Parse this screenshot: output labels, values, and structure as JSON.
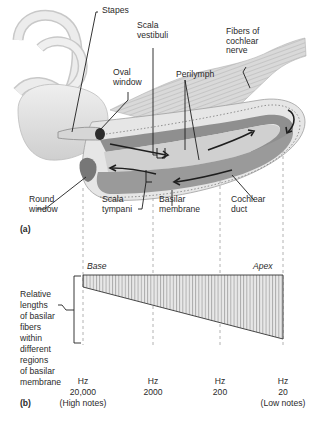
{
  "panel_a": {
    "tag": "(a)",
    "labels": {
      "stapes": "Stapes",
      "scala_vestibuli": "Scala\nvestibuli",
      "fibers_cochlear_nerve": "Fibers of\ncochlear\nnerve",
      "oval_window": "Oval\nwindow",
      "perilymph": "Perilymph",
      "round_window": "Round\nwindow",
      "scala_tympani": "Scala\ntympani",
      "basilar_membrane": "Basilar\nmembrane",
      "cochlear_duct": "Cochlear\nduct"
    }
  },
  "panel_b": {
    "tag": "(b)",
    "base_label": "Base",
    "apex_label": "Apex",
    "side_label": "Relative\nlengths\nof basilar\nfibers\nwithin\ndifferent\nregions\nof basilar\nmembrane",
    "frequencies": [
      {
        "unit": "Hz",
        "value": "20,000",
        "note": "(High notes)"
      },
      {
        "unit": "Hz",
        "value": "2000",
        "note": ""
      },
      {
        "unit": "Hz",
        "value": "200",
        "note": ""
      },
      {
        "unit": "Hz",
        "value": "20",
        "note": "(Low notes)"
      }
    ]
  },
  "colors": {
    "line": "#222222",
    "dash": "#9a9a9a",
    "bone": "#e4e4e4",
    "duct_dark": "#8c8c8c",
    "duct_mid": "#b4b4b4",
    "membrane": "#d2d2d2",
    "hatch_fill": "#dcdcdc"
  }
}
